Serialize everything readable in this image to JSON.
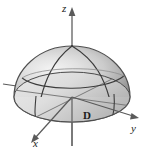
{
  "figure": {
    "background_color": "#ffffff",
    "width": 144,
    "height": 154,
    "axes": {
      "z": {
        "label": "z",
        "direction": "up",
        "arrow": true
      },
      "y": {
        "label": "y",
        "direction": "right",
        "arrow": true
      },
      "x": {
        "label": "x",
        "direction": "down-left",
        "arrow": true
      },
      "axis_color": "#5a5a5a"
    },
    "region": {
      "label": "D",
      "description": "base disk of the hemisphere in the xy-plane"
    },
    "surface": {
      "shape": "hemisphere",
      "outline_color": "#4a4a4a",
      "fill_light": "#f2f2f2",
      "fill_mid": "#c9c9c9",
      "fill_dark": "#8e8e8e",
      "base_fill_light": "#e8e8e8",
      "base_fill_dark": "#b5b5b5",
      "grid_color": "#3c3c3c",
      "grid_curves": [
        "meridian-left",
        "meridian-right",
        "latitude-circle",
        "equator-ellipse"
      ]
    }
  }
}
